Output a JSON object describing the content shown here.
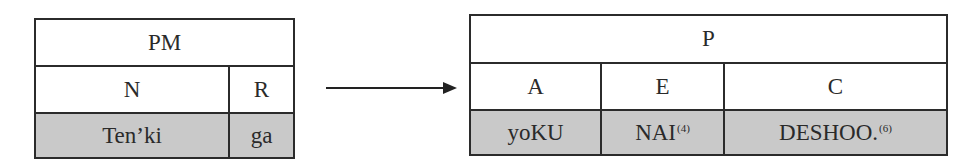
{
  "left_table": {
    "header": "PM",
    "columns": [
      {
        "label": "N",
        "value": "Ten’ki"
      },
      {
        "label": "R",
        "value": "ga"
      }
    ]
  },
  "arrow": {
    "direction": "right"
  },
  "right_table": {
    "header": "P",
    "columns": [
      {
        "label": "A",
        "value": "yoKU",
        "footnote": ""
      },
      {
        "label": "E",
        "value": "NAI",
        "footnote": "(4)"
      },
      {
        "label": "C",
        "value": "DESHOO.",
        "footnote": "(6)"
      }
    ]
  },
  "colors": {
    "shaded_row": "#c9c9c9",
    "border": "#2b2b2b"
  }
}
